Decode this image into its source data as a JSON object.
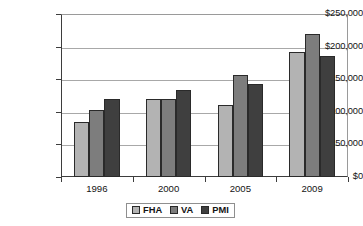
{
  "chart_data": {
    "type": "bar",
    "title": "",
    "subtitle": "",
    "xlabel": "",
    "ylabel": "",
    "categories": [
      "1996",
      "2000",
      "2005",
      "2009"
    ],
    "series": [
      {
        "name": "FHA",
        "color": "#b3b3b3",
        "values": [
          85000,
          120000,
          111000,
          191000
        ]
      },
      {
        "name": "VA",
        "color": "#7d7d7d",
        "values": [
          103000,
          120000,
          156000,
          219000
        ]
      },
      {
        "name": "PMI",
        "color": "#3f3f3f",
        "values": [
          119000,
          133000,
          143000,
          186000
        ]
      }
    ],
    "ylim": [
      0,
      250000
    ],
    "ytick_values": [
      0,
      50000,
      100000,
      150000,
      200000,
      250000
    ],
    "ytick_labels": [
      "$0",
      "$50,000",
      "$100,000",
      "$150,000",
      "$200,000",
      "$250,000"
    ],
    "grid": true,
    "grid_axis": "y",
    "legend_position": "bottom",
    "legend_entries": [
      "FHA",
      "VA",
      "PMI"
    ]
  }
}
